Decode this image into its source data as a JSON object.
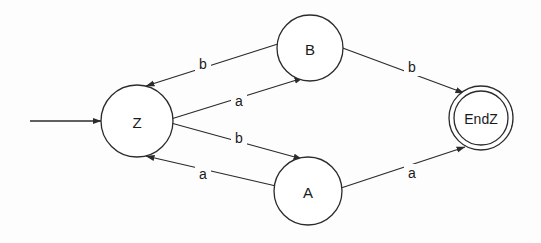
{
  "diagram": {
    "background_color": "#fdfdfd",
    "stroke_color": "#2b2b2b",
    "text_color": "#1a1a1a",
    "width": 541,
    "height": 243
  },
  "states": [
    {
      "id": "Z",
      "label": "Z",
      "cx": 137,
      "cy": 121,
      "r": 36,
      "accepting": false,
      "start": true
    },
    {
      "id": "B",
      "label": "B",
      "cx": 310,
      "cy": 48,
      "r": 33,
      "accepting": false,
      "start": false
    },
    {
      "id": "A",
      "label": "A",
      "cx": 308,
      "cy": 191,
      "r": 34,
      "accepting": false,
      "start": false
    },
    {
      "id": "EndZ",
      "label": "EndZ",
      "cx": 481,
      "cy": 118,
      "r": 32,
      "r_inner": 27,
      "accepting": true,
      "start": false
    }
  ],
  "start_marker": {
    "from_x": 30,
    "to_x": 101,
    "y": 121,
    "label": ""
  },
  "transitions": [
    {
      "id": "B-to-Z",
      "from": "B",
      "to": "Z",
      "symbol": "b",
      "x1": 281,
      "y1": 43,
      "x2": 146,
      "y2": 86,
      "label_x": 203,
      "label_y": 64
    },
    {
      "id": "Z-to-B",
      "from": "Z",
      "to": "B",
      "symbol": "a",
      "x1": 171,
      "y1": 119,
      "x2": 303,
      "y2": 78,
      "label_x": 239,
      "label_y": 101
    },
    {
      "id": "Z-to-A",
      "from": "Z",
      "to": "A",
      "symbol": "b",
      "x1": 171,
      "y1": 123,
      "x2": 302,
      "y2": 159,
      "label_x": 239,
      "label_y": 138
    },
    {
      "id": "A-to-Z",
      "from": "A",
      "to": "Z",
      "symbol": "a",
      "x1": 276,
      "y1": 186,
      "x2": 146,
      "y2": 156,
      "label_x": 203,
      "label_y": 174
    },
    {
      "id": "B-to-EndZ",
      "from": "B",
      "to": "EndZ",
      "symbol": "b",
      "x1": 340,
      "y1": 47,
      "x2": 464,
      "y2": 93,
      "label_x": 412,
      "label_y": 67
    },
    {
      "id": "A-to-EndZ",
      "from": "A",
      "to": "EndZ",
      "symbol": "a",
      "x1": 341,
      "y1": 188,
      "x2": 465,
      "y2": 147,
      "label_x": 412,
      "label_y": 173
    }
  ],
  "alphabet": [
    "a",
    "b"
  ]
}
